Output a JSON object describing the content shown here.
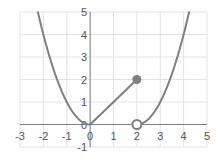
{
  "chart_data": {
    "type": "line",
    "title": "",
    "xlabel": "",
    "ylabel": "",
    "xlim": [
      -3,
      5
    ],
    "ylim": [
      -1,
      5
    ],
    "grid": true,
    "x_ticks": [
      "-3",
      "-2",
      "-1",
      "0",
      "1",
      "2",
      "3",
      "4",
      "5"
    ],
    "y_ticks": [
      "-1",
      "0",
      "1",
      "2",
      "3",
      "4",
      "5"
    ],
    "series": [
      {
        "name": "left branch",
        "formula": "y = x^2",
        "domain": [
          -2.24,
          0
        ]
      },
      {
        "name": "middle segment",
        "formula": "y = x",
        "domain": [
          0,
          2
        ]
      },
      {
        "name": "right branch",
        "formula": "y = (x-2)^2",
        "domain": [
          2,
          4.24
        ]
      }
    ],
    "points": [
      {
        "x": 2,
        "y": 2,
        "style": "closed"
      },
      {
        "x": 2,
        "y": 0,
        "style": "open"
      }
    ],
    "colors": {
      "line": "#7f7f7f",
      "grid": "#e3e3e3",
      "axis": "#808080"
    }
  }
}
